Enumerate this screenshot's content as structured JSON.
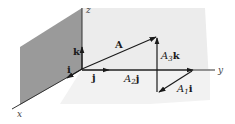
{
  "diagram": {
    "axes": {
      "x": "x",
      "y": "y",
      "z": "z"
    },
    "unit_vectors": {
      "i": "i",
      "j": "j",
      "k": "k"
    },
    "vectors": {
      "A": "A",
      "A1": {
        "coef": "A",
        "sub": "1",
        "unit": "i"
      },
      "A2": {
        "coef": "A",
        "sub": "2",
        "unit": "j"
      },
      "A3": {
        "coef": "A",
        "sub": "3",
        "unit": "k"
      }
    },
    "colors": {
      "left_plane": "#9a9a9a",
      "back_plane": "#ececec",
      "lines": "#1a1a1a"
    }
  }
}
